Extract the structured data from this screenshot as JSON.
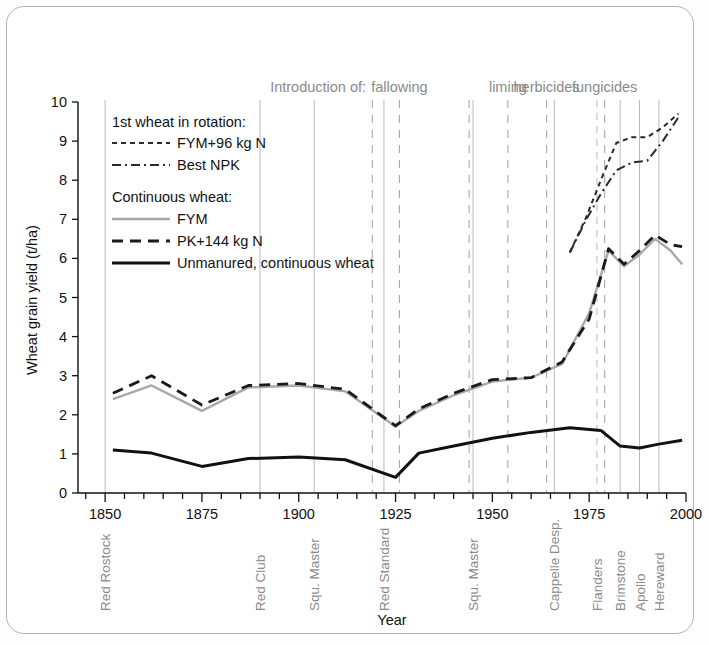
{
  "chart_data": {
    "type": "line",
    "title": "",
    "xlabel": "Year",
    "ylabel": "Wheat grain yield (t/ha)",
    "xlim": [
      1843,
      2000
    ],
    "ylim": [
      0,
      10
    ],
    "xticks_major": [
      1850,
      1875,
      1900,
      1925,
      1950,
      1975,
      2000
    ],
    "xticks_major_labels": [
      "1850",
      "1875",
      "1900",
      "1925",
      "1950",
      "1975",
      "2000"
    ],
    "xtick_minor_step": 5,
    "yticks": [
      0,
      1,
      2,
      3,
      4,
      5,
      6,
      7,
      8,
      9,
      10
    ],
    "ytick_labels": [
      "0",
      "1",
      "2",
      "3",
      "4",
      "5",
      "6",
      "7",
      "8",
      "9",
      "10"
    ],
    "grid": false,
    "legend_position": "upper-left-inside",
    "series": [
      {
        "name": "FYM+96 kg N",
        "group": "1st wheat in rotation:",
        "style": "fine-dashed",
        "color": "#2a2a2a",
        "x": [
          1970,
          1974,
          1978,
          1982,
          1986,
          1990,
          1994,
          1998
        ],
        "values": [
          6.15,
          7.0,
          8.0,
          8.95,
          9.1,
          9.1,
          9.35,
          9.7
        ]
      },
      {
        "name": "Best NPK",
        "group": "1st wheat in rotation:",
        "style": "dash-dot",
        "color": "#2a2a2a",
        "x": [
          1970,
          1974,
          1978,
          1982,
          1986,
          1990,
          1994,
          1998
        ],
        "values": [
          6.15,
          6.95,
          7.65,
          8.25,
          8.45,
          8.5,
          9.0,
          9.6
        ]
      },
      {
        "name": "FYM",
        "group": "Continuous wheat:",
        "style": "solid",
        "color": "#a8a8a8",
        "x": [
          1852,
          1862,
          1875,
          1887,
          1900,
          1912,
          1925,
          1931,
          1940,
          1950,
          1960,
          1968,
          1975,
          1980,
          1984,
          1988,
          1992,
          1996,
          1999
        ],
        "values": [
          2.4,
          2.75,
          2.1,
          2.7,
          2.75,
          2.6,
          1.7,
          2.1,
          2.5,
          2.85,
          2.95,
          3.3,
          4.6,
          6.2,
          5.8,
          6.1,
          6.5,
          6.2,
          5.85
        ]
      },
      {
        "name": "PK+144 kg N",
        "group": "Continuous wheat:",
        "style": "dashed",
        "color": "#1a1a1a",
        "x": [
          1852,
          1862,
          1875,
          1887,
          1900,
          1912,
          1925,
          1931,
          1940,
          1950,
          1960,
          1968,
          1975,
          1980,
          1984,
          1988,
          1992,
          1996,
          1999
        ],
        "values": [
          2.55,
          3.0,
          2.25,
          2.75,
          2.8,
          2.65,
          1.72,
          2.15,
          2.55,
          2.9,
          2.95,
          3.35,
          4.45,
          6.25,
          5.85,
          6.2,
          6.6,
          6.35,
          6.3
        ]
      },
      {
        "name": "Unmanured, continuous wheat",
        "group": "Continuous wheat:",
        "style": "solid-thick",
        "color": "#111111",
        "x": [
          1852,
          1862,
          1875,
          1887,
          1900,
          1912,
          1925,
          1931,
          1940,
          1950,
          1960,
          1970,
          1978,
          1983,
          1988,
          1993,
          1999
        ],
        "values": [
          1.1,
          1.02,
          0.68,
          0.88,
          0.92,
          0.85,
          0.4,
          1.02,
          1.2,
          1.4,
          1.55,
          1.67,
          1.6,
          1.2,
          1.15,
          1.25,
          1.35
        ]
      }
    ],
    "annotation_header": "Introduction of:",
    "annotations": [
      {
        "label": "fallowing",
        "x": 1926,
        "lines": [
          1919,
          1926
        ]
      },
      {
        "label": "liming",
        "x": 1954,
        "lines": [
          1944,
          1954
        ]
      },
      {
        "label": "herbicides",
        "x": 1964,
        "lines": [
          1964
        ]
      },
      {
        "label": "fungicides",
        "x": 1979,
        "lines": [
          1979
        ]
      }
    ],
    "variety_lines": [
      {
        "label": "Red Rostock",
        "x": 1850,
        "style": "solid"
      },
      {
        "label": "Red Club",
        "x": 1890,
        "style": "solid"
      },
      {
        "label": "Squ. Master",
        "x": 1904,
        "style": "solid"
      },
      {
        "label": "Red Standard",
        "x": 1922,
        "style": "solid"
      },
      {
        "label": "Squ. Master",
        "x": 1945,
        "style": "solid"
      },
      {
        "label": "Cappelle Desp.",
        "x": 1966,
        "style": "solid"
      },
      {
        "label": "Flanders",
        "x": 1977,
        "style": "dashed"
      },
      {
        "label": "Brimstone",
        "x": 1983,
        "style": "solid"
      },
      {
        "label": "Apollo",
        "x": 1988,
        "style": "solid"
      },
      {
        "label": "Hereward",
        "x": 1993,
        "style": "solid"
      }
    ]
  },
  "legend": {
    "group1_title": "1st wheat in rotation:",
    "item1": "FYM+96 kg N",
    "item2": "Best NPK",
    "group2_title": "Continuous wheat:",
    "item3": "FYM",
    "item4": "PK+144 kg N",
    "item5": "Unmanured, continuous wheat"
  },
  "axes": {
    "y_title": "Wheat grain yield (t/ha)",
    "x_title": "Year"
  },
  "annotation_header": "Introduction of:",
  "annotation_labels": {
    "fallowing": "fallowing",
    "liming": "liming",
    "herbicides": "herbicides",
    "fungicides": "fungicides"
  },
  "colors": {
    "frame": "#b3b3b3",
    "grayline": "#a8a8a8",
    "blackline": "#111111",
    "annotation_gray": "#8a8a8a"
  }
}
